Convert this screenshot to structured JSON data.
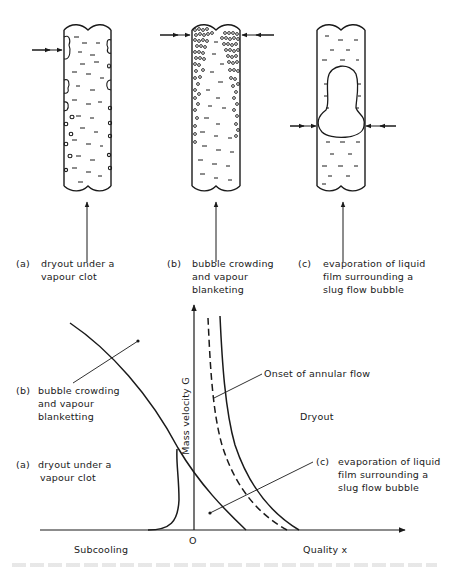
{
  "figure": {
    "panels": [
      {
        "id": "a",
        "tag": "(a)",
        "label_line1": "dryout under a",
        "label_line2": "vapour clot"
      },
      {
        "id": "b",
        "tag": "(b)",
        "label_line1": "bubble crowding",
        "label_line2": "and vapour",
        "label_line3": "blanketing"
      },
      {
        "id": "c",
        "tag": "(c)",
        "label_line1": "evaporation of liquid",
        "label_line2": "film surrounding a",
        "label_line3": "slug flow bubble"
      }
    ],
    "map": {
      "y_axis_label": "Mass velocity G",
      "x_axis_label": "Quality x",
      "origin_label": "O",
      "left_region_label": "Subcooling",
      "right_region_label": "Dryout",
      "annotations": {
        "b": {
          "tag": "(b)",
          "line1": "bubble crowding",
          "line2": "and vapour",
          "line3": "blanketting"
        },
        "a": {
          "tag": "(a)",
          "line1": "dryout under a",
          "line2": "vapour clot"
        },
        "c": {
          "tag": "(c)",
          "line1": "evaporation of liquid",
          "line2": "film surrounding a",
          "line3": "slug flow bubble"
        },
        "annular": "Onset of annular flow"
      }
    }
  }
}
